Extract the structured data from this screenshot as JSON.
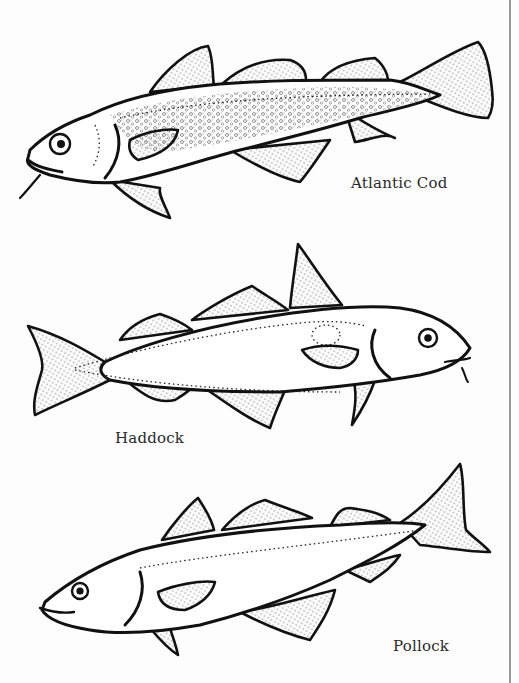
{
  "illustration": {
    "style": "black-and-white line drawing",
    "fish": [
      {
        "name": "Atlantic Cod",
        "label": "Atlantic Cod",
        "facing": "left"
      },
      {
        "name": "Haddock",
        "label": "Haddock",
        "facing": "right"
      },
      {
        "name": "Pollock",
        "label": "Pollock",
        "facing": "left"
      }
    ]
  },
  "colors": {
    "background": "#ffffff",
    "ink": "#111111",
    "page_edge": "#9a9a9a"
  }
}
